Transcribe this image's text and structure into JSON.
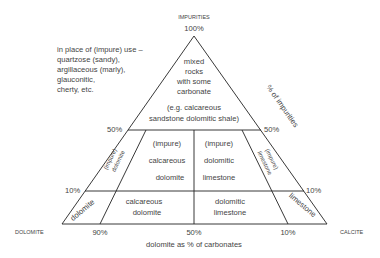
{
  "apex_label": "IMPURITIES",
  "apex_pct": "100%",
  "left_vertex": "DOLOMITE",
  "right_vertex": "CALCITE",
  "note": [
    "in place of (impure) use –",
    "quartzose (sandy),",
    "argillaceous (marly),",
    "glauconitic,",
    "cherty, etc."
  ],
  "right_axis_label": "% of impurities",
  "base_axis_label": "dolomite as % of carbonates",
  "ticks": {
    "left_50": "50%",
    "right_50": "50%",
    "left_10": "10%",
    "right_10": "10%",
    "base_90": "90%",
    "base_50": "50%",
    "base_10": "10%"
  },
  "regions": {
    "top": [
      "mixed",
      "rocks",
      "with some",
      "carbonate"
    ],
    "band_50": [
      "(e.g. calcareous",
      "sandstone dolomitic shale)"
    ],
    "impure_calc_dolomite": [
      "(impure)",
      "calcareous",
      "dolomite"
    ],
    "impure_dol_limestone": [
      "(impure)",
      "dolomitic",
      "limestone"
    ],
    "impure_dolomite": [
      "(impure)",
      "dolomite"
    ],
    "impure_limestone": [
      "(impure)",
      "limestone"
    ],
    "dolomite": "dolomite",
    "calc_dolomite": [
      "calcareous",
      "dolomite"
    ],
    "dol_limestone": [
      "dolomitic",
      "limestone"
    ],
    "limestone": "limestone"
  }
}
